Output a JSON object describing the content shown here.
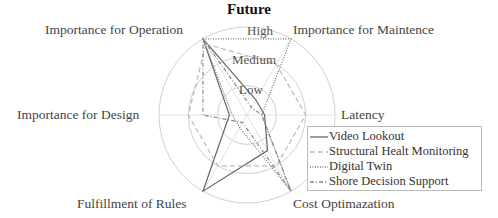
{
  "chart_data": {
    "type": "radar",
    "title": "Future",
    "axes": [
      "Importance for Operation",
      "Importance for Maintence",
      "Latency",
      "Cost Optimazation",
      "Fulfillment of Rules",
      "Importance for Design"
    ],
    "axis_angles_deg": [
      120,
      60,
      0,
      -60,
      -120,
      180
    ],
    "rings": [
      "Low",
      "Medium",
      "High"
    ],
    "range": [
      0,
      3
    ],
    "series": [
      {
        "name": "Video Lookout",
        "style": "solid",
        "color": "#666666",
        "values": [
          3,
          0.6,
          0.6,
          1.4,
          3,
          0.6
        ]
      },
      {
        "name": "Structural Healt Monitoring",
        "style": "dashed",
        "color": "#bbbbbb",
        "values": [
          2.8,
          2,
          2,
          2,
          2,
          2
        ]
      },
      {
        "name": "Digital Twin",
        "style": "dotted",
        "color": "#777777",
        "values": [
          3,
          3,
          0.5,
          3,
          0.5,
          0.5
        ]
      },
      {
        "name": "Shore Decision Support",
        "style": "dashdot",
        "color": "#888888",
        "values": [
          3,
          0.3,
          0.5,
          3,
          0.3,
          1.5
        ]
      }
    ],
    "legend_position": "lower right"
  },
  "labels": {
    "title": "Future",
    "axis_operation": "Importance for Operation",
    "axis_maintenance": "Importance for Maintence",
    "axis_latency": "Latency",
    "axis_cost": "Cost Optimazation",
    "axis_rules": "Fulfillment of Rules",
    "axis_design": "Importance for Design",
    "ring_high": "High",
    "ring_medium": "Medium",
    "ring_low": "Low"
  },
  "legend": {
    "items": [
      "Video Lookout",
      "Structural Healt Monitoring",
      "Digital Twin",
      "Shore Decision Support"
    ]
  }
}
